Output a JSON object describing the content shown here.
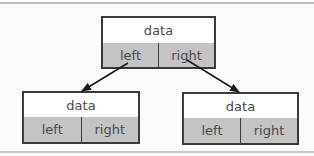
{
  "diagram": {
    "title": "",
    "type": "binary-tree-node-structure",
    "nodes": [
      {
        "id": "root",
        "data_label": "data",
        "left_label": "left",
        "right_label": "right"
      },
      {
        "id": "left-child",
        "data_label": "data",
        "left_label": "left",
        "right_label": "right"
      },
      {
        "id": "right-child",
        "data_label": "data",
        "left_label": "left",
        "right_label": "right"
      }
    ],
    "edges": [
      {
        "from": "root.left",
        "to": "left-child"
      },
      {
        "from": "root.right",
        "to": "right-child"
      }
    ],
    "colors": {
      "border": "#3a3a3a",
      "data_fill": "#ffffff",
      "pointer_fill": "#c4c4c4",
      "text": "#4a4a4a",
      "arrow": "#1a1a1a",
      "background": "#fbfbfb"
    }
  }
}
